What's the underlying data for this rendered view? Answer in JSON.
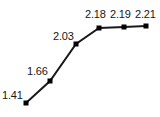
{
  "chart_data": {
    "type": "line",
    "title": "",
    "subtitle": "",
    "xlabel": "",
    "ylabel": "",
    "x": [
      1,
      2,
      3,
      4,
      5,
      6
    ],
    "values": [
      1.41,
      1.66,
      2.03,
      2.18,
      2.19,
      2.21
    ],
    "categories": [
      "",
      "",
      "",
      "",
      "",
      ""
    ],
    "point_labels": [
      "1.41",
      "1.66",
      "2.03",
      "2.18",
      "2.19",
      "2.21"
    ],
    "ylim": [
      1.3,
      2.3
    ],
    "xlim": [
      0.6,
      6.4
    ],
    "grid": false,
    "legend": false,
    "legend_position": "none",
    "axes_visible": false,
    "tick_labels_x": [],
    "tick_labels_y": [],
    "annotations": [],
    "marker": "square",
    "marker_size": 5,
    "line_width": 2,
    "series": [
      {
        "name": "series-1",
        "values": [
          1.41,
          1.66,
          2.03,
          2.18,
          2.19,
          2.21
        ]
      }
    ]
  },
  "style": {
    "line_color": "#1a1a1a",
    "marker_color": "#000000",
    "label_color": "#161616",
    "background": "#ffffff"
  },
  "geometry": {
    "points": [
      {
        "cx": 26,
        "cy": 103,
        "label": "1.41",
        "lx": 2,
        "ly": 90
      },
      {
        "cx": 50,
        "cy": 81,
        "label": "1.66",
        "lx": 27,
        "ly": 66
      },
      {
        "cx": 76,
        "cy": 44,
        "label": "2.03",
        "lx": 53,
        "ly": 31
      },
      {
        "cx": 99,
        "cy": 28,
        "label": "2.18",
        "lx": 85,
        "ly": 9
      },
      {
        "cx": 124,
        "cy": 27,
        "label": "2.19",
        "lx": 110,
        "ly": 9
      },
      {
        "cx": 146,
        "cy": 26,
        "label": "2.21",
        "lx": 135,
        "ly": 9
      }
    ]
  }
}
